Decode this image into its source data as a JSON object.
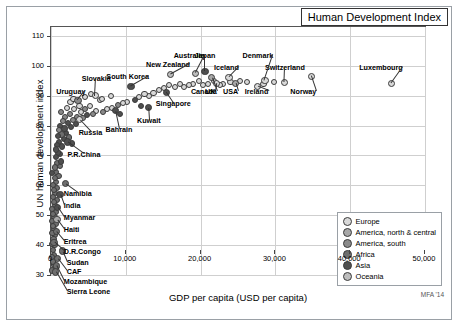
{
  "title": "Human Development Index",
  "credit": "MFA '14",
  "chart_data": {
    "type": "scatter",
    "title": "Human Development Index",
    "xlabel": "GDP per capita (USD per capita)",
    "ylabel": "UN human development index",
    "xlim": [
      0,
      50000
    ],
    "ylim": [
      30,
      113
    ],
    "xticks": [
      0,
      10000,
      20000,
      30000,
      40000,
      50000
    ],
    "xticklabels": [
      "0",
      "10,000",
      "20,000",
      "30,000",
      "40,000",
      "50,000"
    ],
    "yticks": [
      30,
      40,
      50,
      60,
      70,
      80,
      90,
      100,
      110
    ],
    "yticklabels": [
      "30",
      "40",
      "50",
      "60",
      "70",
      "80",
      "90",
      "100",
      "110"
    ],
    "grid": true,
    "legend_position": "bottom-right",
    "legend": [
      {
        "label": "Europe",
        "color": "#d9d9d9"
      },
      {
        "label": "America, north & central",
        "color": "#a8a8a8"
      },
      {
        "label": "America, south",
        "color": "#8a8a8a"
      },
      {
        "label": "Africa",
        "color": "#6e6e6e"
      },
      {
        "label": "Asia",
        "color": "#4f4f4f"
      },
      {
        "label": "Oceania",
        "color": "#bdbdbd"
      }
    ],
    "points": [
      {
        "name": "Luxembourg",
        "x": 45500,
        "y": 94.0,
        "group": "Europe",
        "labeled": true,
        "lx": 41200,
        "ly": 99.5
      },
      {
        "name": "Norway",
        "x": 34800,
        "y": 96.5,
        "group": "Europe",
        "labeled": true,
        "lx": 32000,
        "ly": 91.5
      },
      {
        "name": "Switzerland",
        "x": 31200,
        "y": 94.5,
        "group": "Europe",
        "labeled": true,
        "lx": 28600,
        "ly": 99.5
      },
      {
        "name": "Denmark",
        "x": 28600,
        "y": 95.0,
        "group": "Europe",
        "labeled": true,
        "lx": 25600,
        "ly": 103.5
      },
      {
        "name": "Ireland",
        "x": 27600,
        "y": 93.0,
        "group": "Europe",
        "labeled": true,
        "lx": 25900,
        "ly": 91.5
      },
      {
        "name": "USA",
        "x": 24700,
        "y": 94.0,
        "group": "America, north & central",
        "labeled": true,
        "lx": 23000,
        "ly": 91.5
      },
      {
        "name": "Iceland",
        "x": 23800,
        "y": 96.0,
        "group": "Europe",
        "labeled": true,
        "lx": 21800,
        "ly": 99.5
      },
      {
        "name": "UK",
        "x": 22100,
        "y": 94.0,
        "group": "Europe",
        "labeled": true,
        "lx": 20600,
        "ly": 91.5
      },
      {
        "name": "Canada",
        "x": 21500,
        "y": 96.0,
        "group": "America, north & central",
        "labeled": true,
        "lx": 18700,
        "ly": 91.5
      },
      {
        "name": "Japan",
        "x": 20600,
        "y": 98.0,
        "group": "Asia",
        "labeled": true,
        "lx": 19200,
        "ly": 103.5
      },
      {
        "name": "Australia",
        "x": 19300,
        "y": 97.5,
        "group": "Oceania",
        "labeled": true,
        "lx": 16400,
        "ly": 103.5
      },
      {
        "name": "New Zealand",
        "x": 16000,
        "y": 97.0,
        "group": "Oceania",
        "labeled": true,
        "lx": 12700,
        "ly": 100.5
      },
      {
        "name": "Singapore",
        "x": 15400,
        "y": 91.0,
        "group": "Asia",
        "labeled": true,
        "lx": 14000,
        "ly": 87.5
      },
      {
        "name": "Kuwait",
        "x": 13000,
        "y": 86.0,
        "group": "Asia",
        "labeled": true,
        "lx": 11500,
        "ly": 82.0
      },
      {
        "name": "South Korea",
        "x": 10700,
        "y": 93.0,
        "group": "Asia",
        "labeled": true,
        "lx": 7400,
        "ly": 96.5
      },
      {
        "name": "Bahrain",
        "x": 8600,
        "y": 85.0,
        "group": "Asia",
        "labeled": true,
        "lx": 7300,
        "ly": 79.0
      },
      {
        "name": "Slovakia",
        "x": 5900,
        "y": 90.0,
        "group": "Europe",
        "labeled": true,
        "lx": 4100,
        "ly": 96.0
      },
      {
        "name": "Uruguay",
        "x": 3600,
        "y": 88.5,
        "group": "America, south",
        "labeled": true,
        "lx": 700,
        "ly": 91.5
      },
      {
        "name": "Russia",
        "x": 3800,
        "y": 82.0,
        "group": "Europe",
        "labeled": true,
        "lx": 3700,
        "ly": 78.0
      },
      {
        "name": "P.R.China",
        "x": 2200,
        "y": 74.5,
        "group": "Asia",
        "labeled": true,
        "lx": 2200,
        "ly": 70.5
      },
      {
        "name": "Namibia",
        "x": 1900,
        "y": 60.5,
        "group": "Africa",
        "labeled": true,
        "lx": 1700,
        "ly": 57.5
      },
      {
        "name": "India",
        "x": 1200,
        "y": 57.0,
        "group": "Asia",
        "labeled": true,
        "lx": 1700,
        "ly": 53.5
      },
      {
        "name": "Myanmar",
        "x": 900,
        "y": 52.5,
        "group": "Asia",
        "labeled": true,
        "lx": 1700,
        "ly": 49.5
      },
      {
        "name": "Haiti",
        "x": 800,
        "y": 48.5,
        "group": "America, north & central",
        "labeled": true,
        "lx": 1700,
        "ly": 45.5
      },
      {
        "name": "Eritrea",
        "x": 700,
        "y": 44.5,
        "group": "Africa",
        "labeled": true,
        "lx": 1700,
        "ly": 41.5
      },
      {
        "name": "D.R.Congo",
        "x": 400,
        "y": 41.0,
        "group": "Africa",
        "labeled": true,
        "lx": 1700,
        "ly": 38.0
      },
      {
        "name": "Sudan",
        "x": 1500,
        "y": 38.0,
        "group": "Africa",
        "labeled": true,
        "lx": 2100,
        "ly": 34.5
      },
      {
        "name": "CAF",
        "x": 900,
        "y": 35.5,
        "group": "Africa",
        "labeled": true,
        "lx": 2100,
        "ly": 31.5
      },
      {
        "name": "Mozambique",
        "x": 700,
        "y": 33.0,
        "group": "Africa",
        "labeled": true,
        "lx": 1700,
        "ly": 28.0
      },
      {
        "name": "Sierra Leone",
        "x": 600,
        "y": 31.0,
        "group": "Africa",
        "labeled": true,
        "lx": 2100,
        "ly": 24.5
      }
    ],
    "unlabeled_points": [
      {
        "x": 28400,
        "y": 94.0,
        "group": "Europe"
      },
      {
        "x": 29800,
        "y": 94.5,
        "group": "Europe"
      },
      {
        "x": 26200,
        "y": 94.5,
        "group": "Europe"
      },
      {
        "x": 25300,
        "y": 95.0,
        "group": "Europe"
      },
      {
        "x": 24000,
        "y": 94.5,
        "group": "Europe"
      },
      {
        "x": 23000,
        "y": 94.0,
        "group": "Europe"
      },
      {
        "x": 22600,
        "y": 93.5,
        "group": "Europe"
      },
      {
        "x": 21800,
        "y": 95.0,
        "group": "Europe"
      },
      {
        "x": 21000,
        "y": 94.0,
        "group": "Europe"
      },
      {
        "x": 20300,
        "y": 93.5,
        "group": "Europe"
      },
      {
        "x": 19800,
        "y": 95.0,
        "group": "Europe"
      },
      {
        "x": 19000,
        "y": 94.0,
        "group": "Europe"
      },
      {
        "x": 18500,
        "y": 93.5,
        "group": "Europe"
      },
      {
        "x": 17800,
        "y": 93.0,
        "group": "Europe"
      },
      {
        "x": 17200,
        "y": 94.0,
        "group": "Europe"
      },
      {
        "x": 16600,
        "y": 93.0,
        "group": "Europe"
      },
      {
        "x": 15800,
        "y": 93.5,
        "group": "Europe"
      },
      {
        "x": 15100,
        "y": 92.5,
        "group": "Europe"
      },
      {
        "x": 14400,
        "y": 92.0,
        "group": "Europe"
      },
      {
        "x": 13700,
        "y": 91.0,
        "group": "Europe"
      },
      {
        "x": 13100,
        "y": 90.0,
        "group": "Europe"
      },
      {
        "x": 12500,
        "y": 90.5,
        "group": "Europe"
      },
      {
        "x": 11800,
        "y": 89.5,
        "group": "Europe"
      },
      {
        "x": 11200,
        "y": 88.5,
        "group": "Asia"
      },
      {
        "x": 10200,
        "y": 88.0,
        "group": "Europe"
      },
      {
        "x": 9600,
        "y": 87.5,
        "group": "Europe"
      },
      {
        "x": 9000,
        "y": 87.0,
        "group": "America, south"
      },
      {
        "x": 8200,
        "y": 86.0,
        "group": "Europe"
      },
      {
        "x": 7500,
        "y": 85.5,
        "group": "Europe"
      },
      {
        "x": 7000,
        "y": 84.5,
        "group": "America, south"
      },
      {
        "x": 6500,
        "y": 88.5,
        "group": "Europe"
      },
      {
        "x": 6000,
        "y": 85.0,
        "group": "Europe"
      },
      {
        "x": 5600,
        "y": 84.0,
        "group": "America, south"
      },
      {
        "x": 5200,
        "y": 86.5,
        "group": "Europe"
      },
      {
        "x": 4800,
        "y": 83.5,
        "group": "Asia"
      },
      {
        "x": 4500,
        "y": 85.5,
        "group": "America, south"
      },
      {
        "x": 4200,
        "y": 82.5,
        "group": "America, south"
      },
      {
        "x": 4000,
        "y": 84.5,
        "group": "Europe"
      },
      {
        "x": 3800,
        "y": 86.5,
        "group": "Europe"
      },
      {
        "x": 3500,
        "y": 83.0,
        "group": "America, south"
      },
      {
        "x": 3300,
        "y": 80.5,
        "group": "Asia"
      },
      {
        "x": 3100,
        "y": 85.5,
        "group": "Europe"
      },
      {
        "x": 2900,
        "y": 82.0,
        "group": "America, south"
      },
      {
        "x": 2700,
        "y": 79.5,
        "group": "Asia"
      },
      {
        "x": 2500,
        "y": 84.0,
        "group": "America, south"
      },
      {
        "x": 2300,
        "y": 81.0,
        "group": "Asia"
      },
      {
        "x": 2100,
        "y": 86.0,
        "group": "Europe"
      },
      {
        "x": 2000,
        "y": 77.5,
        "group": "Asia"
      },
      {
        "x": 1900,
        "y": 83.0,
        "group": "America, south"
      },
      {
        "x": 1800,
        "y": 79.0,
        "group": "Asia"
      },
      {
        "x": 1700,
        "y": 75.5,
        "group": "Asia"
      },
      {
        "x": 1600,
        "y": 81.5,
        "group": "America, south"
      },
      {
        "x": 1500,
        "y": 73.0,
        "group": "Asia"
      },
      {
        "x": 1400,
        "y": 77.0,
        "group": "Africa"
      },
      {
        "x": 1300,
        "y": 84.5,
        "group": "America, south"
      },
      {
        "x": 1250,
        "y": 70.5,
        "group": "Asia"
      },
      {
        "x": 1200,
        "y": 80.0,
        "group": "Asia"
      },
      {
        "x": 1150,
        "y": 66.5,
        "group": "Africa"
      },
      {
        "x": 1100,
        "y": 74.5,
        "group": "Asia"
      },
      {
        "x": 1050,
        "y": 78.5,
        "group": "America, south"
      },
      {
        "x": 1000,
        "y": 63.0,
        "group": "Africa"
      },
      {
        "x": 950,
        "y": 71.0,
        "group": "Asia"
      },
      {
        "x": 900,
        "y": 76.5,
        "group": "Asia"
      },
      {
        "x": 850,
        "y": 59.0,
        "group": "Africa"
      },
      {
        "x": 800,
        "y": 67.5,
        "group": "Africa"
      },
      {
        "x": 780,
        "y": 73.5,
        "group": "Asia"
      },
      {
        "x": 750,
        "y": 55.0,
        "group": "Africa"
      },
      {
        "x": 720,
        "y": 64.5,
        "group": "Africa"
      },
      {
        "x": 700,
        "y": 69.5,
        "group": "Asia"
      },
      {
        "x": 680,
        "y": 51.0,
        "group": "Africa"
      },
      {
        "x": 650,
        "y": 61.0,
        "group": "Africa"
      },
      {
        "x": 620,
        "y": 72.0,
        "group": "Asia"
      },
      {
        "x": 600,
        "y": 47.0,
        "group": "Africa"
      },
      {
        "x": 580,
        "y": 57.5,
        "group": "Africa"
      },
      {
        "x": 560,
        "y": 66.0,
        "group": "Africa"
      },
      {
        "x": 540,
        "y": 43.5,
        "group": "Africa"
      },
      {
        "x": 520,
        "y": 53.5,
        "group": "Africa"
      },
      {
        "x": 500,
        "y": 62.5,
        "group": "Africa"
      },
      {
        "x": 480,
        "y": 40.0,
        "group": "Africa"
      },
      {
        "x": 460,
        "y": 49.5,
        "group": "Africa"
      },
      {
        "x": 440,
        "y": 58.5,
        "group": "Africa"
      },
      {
        "x": 420,
        "y": 36.5,
        "group": "Africa"
      },
      {
        "x": 400,
        "y": 45.5,
        "group": "Africa"
      },
      {
        "x": 380,
        "y": 54.5,
        "group": "Africa"
      },
      {
        "x": 360,
        "y": 33.5,
        "group": "Africa"
      },
      {
        "x": 340,
        "y": 42.0,
        "group": "Africa"
      },
      {
        "x": 320,
        "y": 50.5,
        "group": "Africa"
      },
      {
        "x": 300,
        "y": 60.0,
        "group": "Africa"
      },
      {
        "x": 280,
        "y": 38.5,
        "group": "Africa"
      },
      {
        "x": 260,
        "y": 46.5,
        "group": "Africa"
      },
      {
        "x": 240,
        "y": 56.0,
        "group": "Africa"
      },
      {
        "x": 220,
        "y": 34.5,
        "group": "Africa"
      },
      {
        "x": 200,
        "y": 44.0,
        "group": "Africa"
      },
      {
        "x": 180,
        "y": 52.0,
        "group": "Africa"
      },
      {
        "x": 160,
        "y": 31.5,
        "group": "Africa"
      },
      {
        "x": 150,
        "y": 40.5,
        "group": "Africa"
      },
      {
        "x": 140,
        "y": 48.0,
        "group": "Africa"
      },
      {
        "x": 130,
        "y": 36.0,
        "group": "Africa"
      },
      {
        "x": 120,
        "y": 64.0,
        "group": "Asia"
      },
      {
        "x": 2600,
        "y": 88.0,
        "group": "Europe"
      },
      {
        "x": 3000,
        "y": 89.0,
        "group": "Europe"
      },
      {
        "x": 4600,
        "y": 89.5,
        "group": "Europe"
      },
      {
        "x": 5400,
        "y": 90.5,
        "group": "Europe"
      },
      {
        "x": 6800,
        "y": 89.0,
        "group": "Europe"
      },
      {
        "x": 8000,
        "y": 90.0,
        "group": "Europe"
      },
      {
        "x": 9200,
        "y": 84.0,
        "group": "Asia"
      },
      {
        "x": 12000,
        "y": 86.5,
        "group": "Asia"
      },
      {
        "x": 2400,
        "y": 76.0,
        "group": "Africa"
      },
      {
        "x": 2800,
        "y": 74.0,
        "group": "Asia"
      },
      {
        "x": 1350,
        "y": 68.0,
        "group": "Asia"
      }
    ]
  }
}
